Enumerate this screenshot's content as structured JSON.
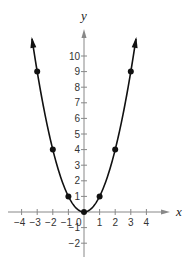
{
  "chart_data": {
    "type": "line",
    "title": "",
    "function": "y = x^2",
    "xlabel": "x",
    "ylabel": "y",
    "xlim": [
      -4.5,
      5.5
    ],
    "ylim": [
      -3,
      12
    ],
    "grid": false,
    "legend": null,
    "x_ticks": [
      -4,
      -3,
      -2,
      -1,
      1,
      2,
      3,
      4
    ],
    "y_ticks": [
      -2,
      -1,
      1,
      2,
      3,
      4,
      5,
      6,
      7,
      8,
      9,
      10
    ],
    "origin_label": "0",
    "series": [
      {
        "name": "y = x^2",
        "x": [
          -3,
          -2,
          -1,
          0,
          1,
          2,
          3
        ],
        "y": [
          9,
          4,
          1,
          0,
          1,
          4,
          9
        ],
        "markers": true,
        "curve_extends_with_arrows": true
      }
    ]
  },
  "colors": {
    "curve": "#111111",
    "axis": "#888888",
    "text": "#333333",
    "background": "#ffffff"
  },
  "layout": {
    "origin_px": [
      84,
      212
    ],
    "unit_px": 15.6
  }
}
